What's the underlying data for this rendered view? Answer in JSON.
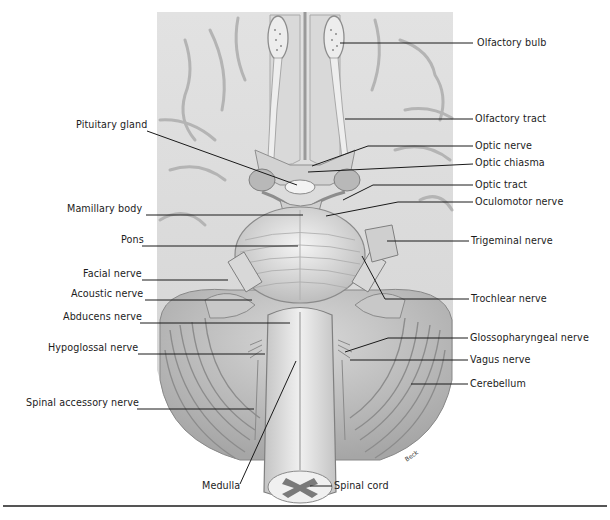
{
  "figure": {
    "artist_signature": "Beck",
    "colors": {
      "background": "#ffffff",
      "tissue_light": "#e6e6e6",
      "tissue_mid": "#c9c9c9",
      "tissue_dark": "#8f8f8f",
      "leader_line": "#1a1a1a",
      "spinal_gray_matter": "#7a7a7a"
    }
  },
  "labels": {
    "left": [
      {
        "id": "pituitary-gland",
        "text": "Pituitary gland",
        "x": 76,
        "y": 125
      },
      {
        "id": "mamillary-body",
        "text": "Mamillary body",
        "x": 67,
        "y": 209
      },
      {
        "id": "pons",
        "text": "Pons",
        "x": 121,
        "y": 240
      },
      {
        "id": "facial-nerve",
        "text": "Facial nerve",
        "x": 83,
        "y": 274
      },
      {
        "id": "acoustic-nerve",
        "text": "Acoustic nerve",
        "x": 71,
        "y": 294
      },
      {
        "id": "abducens-nerve",
        "text": "Abducens nerve",
        "x": 63,
        "y": 317
      },
      {
        "id": "hypoglossal-nerve",
        "text": "Hypoglossal nerve",
        "x": 48,
        "y": 348
      },
      {
        "id": "spinal-accessory-nerve",
        "text": "Spinal accessory nerve",
        "x": 26,
        "y": 403
      }
    ],
    "right": [
      {
        "id": "olfactory-bulb",
        "text": "Olfactory bulb",
        "x": 477,
        "y": 37
      },
      {
        "id": "olfactory-tract",
        "text": "Olfactory tract",
        "x": 475,
        "y": 113
      },
      {
        "id": "optic-nerve",
        "text": "Optic nerve",
        "x": 475,
        "y": 140
      },
      {
        "id": "optic-chiasma",
        "text": "Optic chiasma",
        "x": 475,
        "y": 157
      },
      {
        "id": "optic-tract",
        "text": "Optic tract",
        "x": 475,
        "y": 179
      },
      {
        "id": "oculomotor-nerve",
        "text": "Oculomotor nerve",
        "x": 475,
        "y": 196
      },
      {
        "id": "trigeminal-nerve",
        "text": "Trigeminal nerve",
        "x": 471,
        "y": 235
      },
      {
        "id": "trochlear-nerve",
        "text": "Trochlear nerve",
        "x": 471,
        "y": 293
      },
      {
        "id": "glossopharyngeal-nerve",
        "text": "Glossopharyngeal nerve",
        "x": 470,
        "y": 332
      },
      {
        "id": "vagus-nerve",
        "text": "Vagus nerve",
        "x": 470,
        "y": 354
      },
      {
        "id": "cerebellum",
        "text": "Cerebellum",
        "x": 470,
        "y": 378
      }
    ],
    "bottom": [
      {
        "id": "medulla",
        "text": "Medulla",
        "x": 202,
        "y": 480
      },
      {
        "id": "spinal-cord",
        "text": "Spinal cord",
        "x": 334,
        "y": 480
      }
    ]
  }
}
